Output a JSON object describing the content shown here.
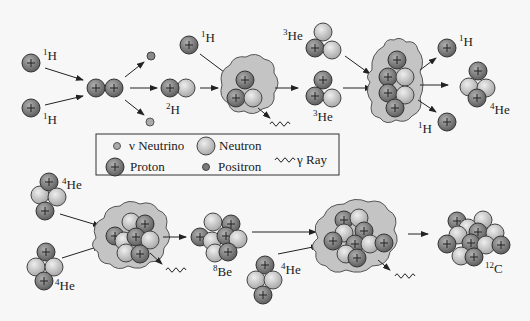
{
  "diagram": {
    "labels": {
      "h1_a": {
        "sup": "1",
        "text": "H"
      },
      "h1_b": {
        "sup": "1",
        "text": "H"
      },
      "h2": {
        "sup": "2",
        "text": "H"
      },
      "h1_c": {
        "sup": "1",
        "text": "H"
      },
      "he3_top": {
        "sup": "3",
        "text": "He"
      },
      "he3_mid": {
        "sup": "3",
        "text": "He"
      },
      "h1_out_top": {
        "sup": "1",
        "text": "H"
      },
      "h1_out_bot": {
        "sup": "1",
        "text": "H"
      },
      "he4_product": {
        "sup": "4",
        "text": "He"
      },
      "he4_a": {
        "sup": "4",
        "text": "He"
      },
      "he4_b": {
        "sup": "4",
        "text": "He"
      },
      "be8": {
        "sup": "8",
        "text": "Be"
      },
      "he4_c": {
        "sup": "4",
        "text": "He"
      },
      "c12": {
        "sup": "12",
        "text": "C"
      }
    },
    "legend": {
      "neutrino": "ν Neutrino",
      "neutron": "Neutron",
      "gamma": "γ Ray",
      "proton": "Proton",
      "positron": "Positron"
    },
    "colors": {
      "proton": "#7a7a7a",
      "neutron": "#c8c8c8",
      "cloud": "#c4c4c4",
      "background": "#f7f7f7"
    }
  }
}
